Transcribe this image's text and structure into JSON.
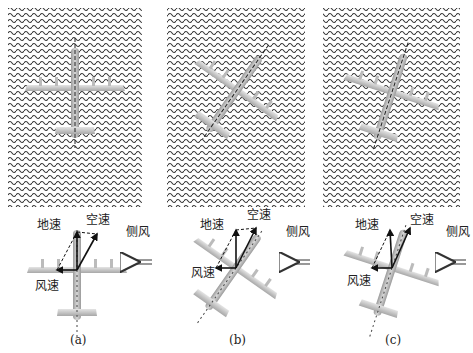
{
  "figure": {
    "panels": [
      {
        "id": "a",
        "caption": "(a)",
        "labels": {
          "ground_speed": "地速",
          "air_speed": "空速",
          "crosswind": "侧风",
          "wind_speed": "风速"
        },
        "heading_deg": 0
      },
      {
        "id": "b",
        "caption": "(b)",
        "labels": {
          "ground_speed": "地速",
          "air_speed": "空速",
          "crosswind": "侧风",
          "wind_speed": "风速"
        },
        "heading_deg": 35
      },
      {
        "id": "c",
        "caption": "(c)",
        "labels": {
          "ground_speed": "地速",
          "air_speed": "空速",
          "crosswind": "侧风",
          "wind_speed": "风速"
        },
        "heading_deg": 18
      }
    ]
  }
}
